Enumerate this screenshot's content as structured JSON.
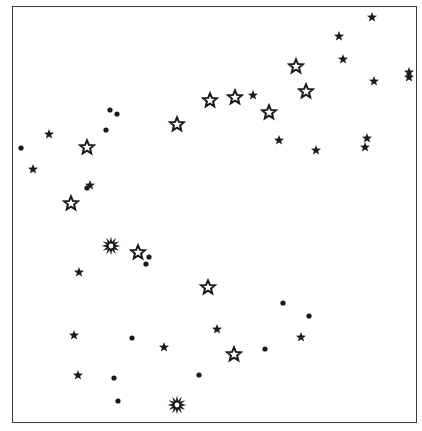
{
  "chart": {
    "frame": {
      "left": 12,
      "top": 6,
      "right": 417,
      "bottom": 423
    },
    "ink_color": "#1a1a1a",
    "background_color": "#ffffff"
  },
  "legend_symbols": {
    "dot": "filled-circle",
    "star_filled": "solid-five-point-star",
    "star_open": "outlined-five-point-star",
    "burst": "outlined-multi-point-starburst"
  },
  "points": [
    {
      "type": "dot",
      "x": 21,
      "y": 148
    },
    {
      "type": "dot",
      "x": 110,
      "y": 110
    },
    {
      "type": "dot",
      "x": 117,
      "y": 114
    },
    {
      "type": "dot",
      "x": 106,
      "y": 130
    },
    {
      "type": "dot",
      "x": 87,
      "y": 188
    },
    {
      "type": "dot",
      "x": 149,
      "y": 257
    },
    {
      "type": "dot",
      "x": 146,
      "y": 264
    },
    {
      "type": "dot",
      "x": 132,
      "y": 338
    },
    {
      "type": "dot",
      "x": 114,
      "y": 378
    },
    {
      "type": "dot",
      "x": 118,
      "y": 401
    },
    {
      "type": "dot",
      "x": 283,
      "y": 303
    },
    {
      "type": "dot",
      "x": 309,
      "y": 316
    },
    {
      "type": "dot",
      "x": 265,
      "y": 349
    },
    {
      "type": "dot",
      "x": 199,
      "y": 375
    },
    {
      "type": "star_filled",
      "x": 49,
      "y": 134
    },
    {
      "type": "star_filled",
      "x": 33,
      "y": 169
    },
    {
      "type": "star_filled",
      "x": 90,
      "y": 185
    },
    {
      "type": "star_filled",
      "x": 79,
      "y": 272
    },
    {
      "type": "star_filled",
      "x": 74,
      "y": 335
    },
    {
      "type": "star_filled",
      "x": 78,
      "y": 375
    },
    {
      "type": "star_filled",
      "x": 164,
      "y": 347
    },
    {
      "type": "star_filled",
      "x": 217,
      "y": 329
    },
    {
      "type": "star_filled",
      "x": 301,
      "y": 337
    },
    {
      "type": "star_filled",
      "x": 253,
      "y": 95
    },
    {
      "type": "star_filled",
      "x": 279,
      "y": 140
    },
    {
      "type": "star_filled",
      "x": 316,
      "y": 150
    },
    {
      "type": "star_filled",
      "x": 372,
      "y": 17
    },
    {
      "type": "star_filled",
      "x": 339,
      "y": 36
    },
    {
      "type": "star_filled",
      "x": 343,
      "y": 59
    },
    {
      "type": "star_filled",
      "x": 374,
      "y": 81
    },
    {
      "type": "star_filled",
      "x": 409,
      "y": 72
    },
    {
      "type": "star_filled",
      "x": 409,
      "y": 77
    },
    {
      "type": "star_filled",
      "x": 367,
      "y": 138
    },
    {
      "type": "star_filled",
      "x": 365,
      "y": 147
    },
    {
      "type": "star_open",
      "x": 87,
      "y": 147
    },
    {
      "type": "star_open",
      "x": 71,
      "y": 203
    },
    {
      "type": "star_open",
      "x": 177,
      "y": 124
    },
    {
      "type": "star_open",
      "x": 210,
      "y": 100
    },
    {
      "type": "star_open",
      "x": 235,
      "y": 97
    },
    {
      "type": "star_open",
      "x": 269,
      "y": 112
    },
    {
      "type": "star_open",
      "x": 296,
      "y": 66
    },
    {
      "type": "star_open",
      "x": 306,
      "y": 91
    },
    {
      "type": "star_open",
      "x": 138,
      "y": 252
    },
    {
      "type": "star_open",
      "x": 208,
      "y": 287
    },
    {
      "type": "star_open",
      "x": 234,
      "y": 354
    },
    {
      "type": "burst",
      "x": 111,
      "y": 246
    },
    {
      "type": "burst",
      "x": 177,
      "y": 405
    }
  ]
}
